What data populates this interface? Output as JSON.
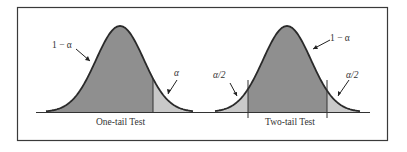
{
  "figure": {
    "panels": [
      {
        "title": "One-tail Test",
        "center_label": "1 − α",
        "tail_label": "α"
      },
      {
        "title": "Two-tail Test",
        "center_label": "1 − α",
        "left_tail_label": "α/2",
        "right_tail_label": "α/2"
      }
    ],
    "colors": {
      "center_fill": "#8f8f8f",
      "tail_fill": "#c9c9c9",
      "curve": "#2a2a2a",
      "frame": "#3a3a3a"
    }
  }
}
